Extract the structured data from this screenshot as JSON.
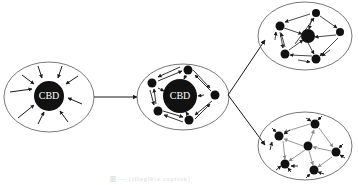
{
  "figure": {
    "stages": [
      {
        "id": "stage-1",
        "label": "CBD",
        "description": "monocentric: all flows converge on CBD"
      },
      {
        "id": "stage-2",
        "label": "CBD",
        "description": "CBD with surrounding sub-centers and bidirectional flows"
      },
      {
        "id": "stage-3a",
        "label": "",
        "description": "polycentric network with dominant center"
      },
      {
        "id": "stage-3b",
        "label": "",
        "description": "polycentric network of equal centers"
      }
    ],
    "caption": "图 — (illegible caption)",
    "colors": {
      "ink": "#1a1a1a",
      "node": "#111111",
      "ellipse_stroke": "#555555",
      "gray_arrow": "#8a8a8a",
      "caption": "#d0d0d0"
    }
  }
}
